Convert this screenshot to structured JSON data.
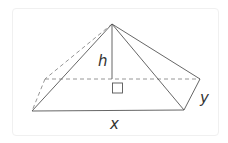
{
  "diagram": {
    "type": "pyramid",
    "labels": {
      "height": "h",
      "base_length": "x",
      "base_width": "y"
    },
    "colors": {
      "line": "#555555",
      "dashed": "#8a8a8a",
      "text": "#333333",
      "frame": "#f0f0f0"
    },
    "vertices": {
      "apex": [
        112,
        24
      ],
      "front_left": [
        32,
        111
      ],
      "front_right": [
        184,
        110
      ],
      "back_right": [
        200,
        79
      ],
      "back_left": [
        45,
        79
      ],
      "height_foot": [
        112,
        79
      ]
    }
  }
}
